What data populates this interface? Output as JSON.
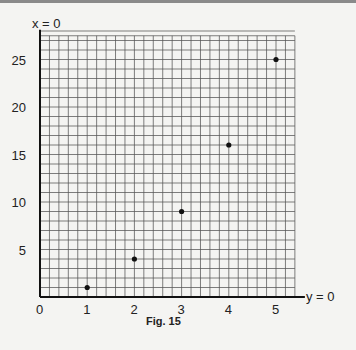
{
  "chart_data": {
    "type": "scatter",
    "title": "",
    "caption": "Fig. 15",
    "xlabel": "y = 0",
    "ylabel": "x = 0",
    "x_ticks": [
      "0",
      "1",
      "2",
      "3",
      "4",
      "5"
    ],
    "y_ticks": [
      "5",
      "10",
      "15",
      "20",
      "25"
    ],
    "xlim": [
      0,
      5.4
    ],
    "ylim": [
      0,
      27.5
    ],
    "grid": true,
    "grid_minor_x_per_unit": 5,
    "grid_minor_y_per_unit": 1,
    "points": [
      {
        "x": 1,
        "y": 1
      },
      {
        "x": 2,
        "y": 4
      },
      {
        "x": 3,
        "y": 9
      },
      {
        "x": 4,
        "y": 16
      },
      {
        "x": 5,
        "y": 25
      }
    ],
    "colors": {
      "background": "#f4f4f2",
      "grid": "#555555",
      "axis": "#111111",
      "point": "#111111"
    }
  }
}
